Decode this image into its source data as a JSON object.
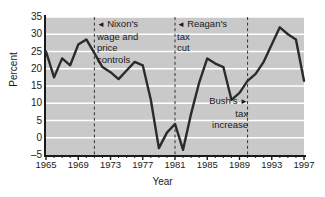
{
  "chart_data": {
    "type": "line",
    "title": "",
    "xlabel": "Year",
    "ylabel": "Percent",
    "xlim": [
      1965,
      1997
    ],
    "ylim": [
      -5,
      35
    ],
    "grid": true,
    "legend": "none",
    "yticks": [
      35,
      30,
      25,
      20,
      15,
      10,
      5,
      0,
      -5
    ],
    "xticks": [
      1965,
      1969,
      1973,
      1977,
      1981,
      1985,
      1989,
      1993,
      1997
    ],
    "x_minor_tick_step": 1,
    "line_color": "#2b2b2b",
    "plot_background": "#c9c9c9",
    "gridline_color": "#ffffff",
    "x": [
      1965,
      1966,
      1967,
      1968,
      1969,
      1970,
      1971,
      1972,
      1973,
      1974,
      1975,
      1976,
      1977,
      1978,
      1979,
      1980,
      1981,
      1982,
      1983,
      1984,
      1985,
      1986,
      1987,
      1988,
      1989,
      1990,
      1991,
      1992,
      1993,
      1994,
      1995,
      1996,
      1997
    ],
    "values": [
      25.0,
      17.5,
      23.0,
      21.0,
      27.0,
      28.5,
      24.5,
      20.5,
      19.0,
      17.0,
      19.5,
      22.0,
      21.0,
      11.0,
      -3.0,
      1.5,
      4.0,
      -3.5,
      7.0,
      16.0,
      23.0,
      21.5,
      20.5,
      11.0,
      13.0,
      16.5,
      18.5,
      22.0,
      27.0,
      32.0,
      30.0,
      28.5,
      16.5
    ],
    "annotations": [
      {
        "id": "nixon",
        "text": "Nixon's\nwage and\nprice\ncontrols",
        "arrow": "◄",
        "arrow_side": "left",
        "year": 1971
      },
      {
        "id": "reagan",
        "text": "Reagan's\ntax\ncut",
        "arrow": "◄",
        "arrow_side": "left",
        "year": 1981
      },
      {
        "id": "bush",
        "text": "Bush's\ntax\nincrease",
        "arrow": "►",
        "arrow_side": "right",
        "year": 1990
      }
    ],
    "vertical_markers": [
      1971,
      1981,
      1990
    ]
  },
  "annotation_lines": {
    "nixon": [
      "Nixon's",
      "wage and",
      "price",
      "controls"
    ],
    "reagan": [
      "Reagan's",
      "tax",
      "cut"
    ],
    "bush": [
      "Bush's",
      "tax",
      "increase"
    ]
  },
  "arrows": {
    "left": "◄",
    "right": "►"
  }
}
